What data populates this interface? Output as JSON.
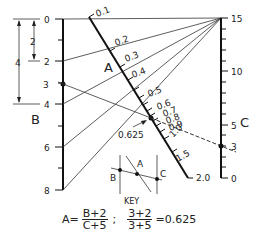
{
  "diagram": {
    "type": "nomogram",
    "scales": {
      "B": {
        "label": "B",
        "ticks": [
          "0",
          "2",
          "4",
          "6",
          "8"
        ],
        "marked_value": "3"
      },
      "A": {
        "label": "A",
        "ticks": [
          "0.1",
          "0.2",
          "0.3",
          "0.4",
          "0.5",
          "0.6",
          "0.7",
          "0.8",
          "0.9",
          "1.0",
          "1.5",
          "2.0"
        ],
        "result_value": "0.625"
      },
      "C": {
        "label": "C",
        "ticks": [
          "0",
          "3",
          "5",
          "10",
          "15"
        ],
        "marked_value": "3"
      }
    },
    "dimensions": {
      "small": "2",
      "large": "4"
    },
    "key": {
      "title": "KEY",
      "labels": [
        "B",
        "A",
        "C"
      ]
    },
    "formula": {
      "lhs": "A=",
      "num1": "B+2",
      "den1": "C+5",
      "sep": ";",
      "num2": "3+2",
      "den2": "3+5",
      "result": "=0.625"
    },
    "colors": {
      "ink": "#111111",
      "background": "#ffffff"
    }
  }
}
